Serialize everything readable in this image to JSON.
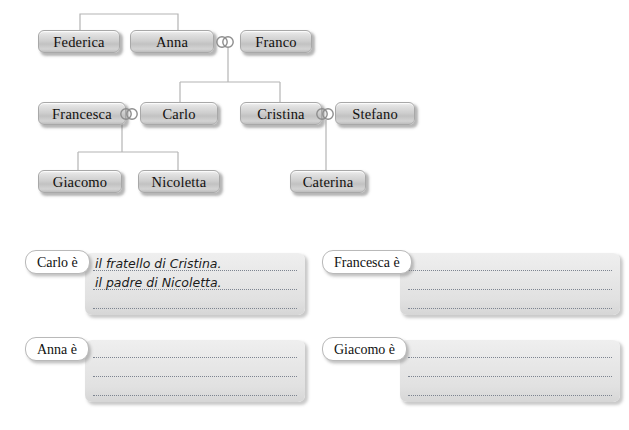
{
  "worksheet": {
    "tree": {
      "people": [
        {
          "id": "federica",
          "name": "Federica",
          "x": 38,
          "y": 30,
          "w": 82
        },
        {
          "id": "anna",
          "name": "Anna",
          "x": 130,
          "y": 30,
          "w": 84
        },
        {
          "id": "franco",
          "name": "Franco",
          "x": 240,
          "y": 30,
          "w": 72
        },
        {
          "id": "francesca",
          "name": "Francesca",
          "x": 38,
          "y": 102,
          "w": 88
        },
        {
          "id": "carlo",
          "name": "Carlo",
          "x": 140,
          "y": 102,
          "w": 78
        },
        {
          "id": "cristina",
          "name": "Cristina",
          "x": 240,
          "y": 102,
          "w": 82
        },
        {
          "id": "stefano",
          "name": "Stefano",
          "x": 335,
          "y": 102,
          "w": 80
        },
        {
          "id": "giacomo",
          "name": "Giacomo",
          "x": 38,
          "y": 170,
          "w": 84
        },
        {
          "id": "nicoletta",
          "name": "Nicoletta",
          "x": 138,
          "y": 170,
          "w": 82
        },
        {
          "id": "caterina",
          "name": "Caterina",
          "x": 290,
          "y": 170,
          "w": 76
        }
      ],
      "marriages": [
        {
          "id": "anna-franco",
          "x": 214,
          "y": 35
        },
        {
          "id": "francesca-carlo",
          "x": 118,
          "y": 107
        },
        {
          "id": "cristina-stefano",
          "x": 314,
          "y": 107
        }
      ],
      "connector_color": "#b0b0b0"
    },
    "exercises": [
      {
        "id": "carlo",
        "label": "Carlo è",
        "answers": [
          "il fratello di Cristina.",
          "il padre di Nicoletta.",
          ""
        ]
      },
      {
        "id": "francesca",
        "label": "Francesca è",
        "answers": [
          "",
          "",
          ""
        ]
      },
      {
        "id": "anna",
        "label": "Anna è",
        "answers": [
          "",
          "",
          ""
        ]
      },
      {
        "id": "giacomo",
        "label": "Giacomo è",
        "answers": [
          "",
          "",
          ""
        ]
      }
    ]
  }
}
